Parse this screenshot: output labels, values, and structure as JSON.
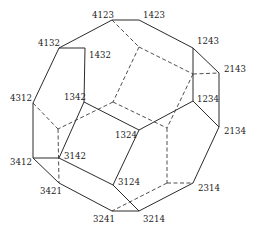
{
  "labels": {
    "v4123": "4123",
    "v1423": "1423",
    "v4132": "4132",
    "v1432": "1432",
    "v1243": "1243",
    "v2143": "2143",
    "v4312": "4312",
    "v1342": "1342",
    "v1234": "1234",
    "v2134": "2134",
    "v1324": "1324",
    "v3412": "3412",
    "v3142": "3142",
    "v3421": "3421",
    "v3124": "3124",
    "v2314": "2314",
    "v3241": "3241",
    "v3214": "3214"
  },
  "edge_styles": {
    "visible": "solid",
    "hidden": "dashed"
  }
}
